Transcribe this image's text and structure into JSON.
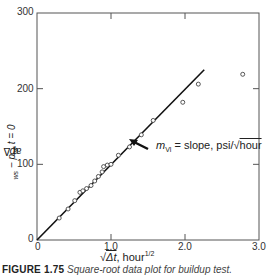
{
  "chart_data": {
    "type": "scatter",
    "title": "",
    "xlabel": "√Δt, hour^1/2",
    "ylabel": "p_ws − p_wf at Δt = 0",
    "xlim": [
      0,
      3.0
    ],
    "ylim": [
      0,
      300
    ],
    "x_ticks": [
      "0",
      "1.0",
      "2.0",
      "3.0"
    ],
    "y_ticks": [
      "0",
      "100",
      "200",
      "300"
    ],
    "grid": false,
    "legend": null,
    "series": [
      {
        "name": "Buildup data",
        "marker": "open-circle",
        "x": [
          0.3,
          0.42,
          0.51,
          0.58,
          0.62,
          0.67,
          0.73,
          0.78,
          0.83,
          0.88,
          0.9,
          0.95,
          1.0,
          1.1,
          1.25,
          1.41,
          1.57,
          1.97,
          2.18,
          2.78
        ],
        "y": [
          29,
          41,
          52,
          63,
          65,
          68,
          72,
          78,
          84,
          90,
          97,
          99,
          100,
          112,
          123,
          139,
          158,
          182,
          206,
          219
        ]
      },
      {
        "name": "Straight-line fit",
        "type": "line",
        "x": [
          0,
          2.26
        ],
        "y": [
          0,
          225
        ]
      }
    ],
    "annotations": [
      {
        "text": "m_Vl = slope, psi/√hour",
        "arrow_to": [
          1.27,
          130
        ]
      }
    ]
  },
  "labels": {
    "y_axis": "p",
    "y_axis_full": "pws − pwf at Δt = 0",
    "x_axis_prefix": "√",
    "x_axis_main": "Δt, hour",
    "x_axis_sup": "1/2",
    "annotation_m": "m",
    "annotation_sub": "Vl",
    "annotation_rest": " = slope, psi/",
    "annotation_sqrt": "hour",
    "y_tick_0": "0",
    "y_tick_100": "100",
    "y_tick_200": "200",
    "y_tick_300": "300",
    "x_tick_0": "0",
    "x_tick_1": "1.0",
    "x_tick_2": "2.0",
    "x_tick_3": "3.0"
  },
  "caption": {
    "figure_number": "FIGURE 1.75",
    "text": "Square-root data plot for buildup test."
  }
}
